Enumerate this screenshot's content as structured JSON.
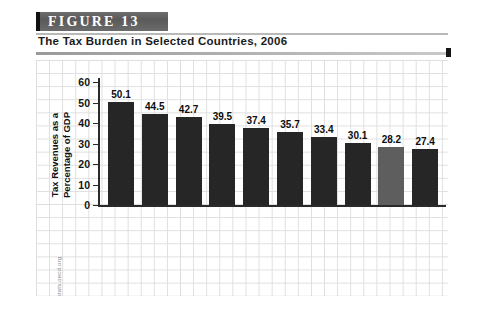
{
  "figure": {
    "banner_label": "FIGURE  13",
    "subtitle": "The Tax Burden in Selected Countries, 2006",
    "source": "SOURCE: www.stats.oecd.org"
  },
  "chart_data": {
    "type": "bar",
    "title": "The Tax Burden in Selected Countries, 2006",
    "xlabel": "",
    "ylabel": "Tax Revenues as a Percentage of GDP",
    "ylim": [
      0,
      60
    ],
    "yticks": [
      0,
      10,
      20,
      30,
      40,
      50,
      60
    ],
    "grid": true,
    "legend": "none",
    "categories": [
      "Sweden",
      "France",
      "Italy",
      "Netherlands",
      "United Kingdom",
      "Germany",
      "Canada",
      "Switzerland",
      "United States",
      "Japan"
    ],
    "category_lines": [
      [
        "Sweden"
      ],
      [
        "France"
      ],
      [
        "Italy"
      ],
      [
        "Netherlands"
      ],
      [
        "United",
        "Kingdom"
      ],
      [
        "Germany"
      ],
      [
        "Canada"
      ],
      [
        "Switzerland"
      ],
      [
        "United",
        "States"
      ],
      [
        "Japan"
      ]
    ],
    "values": [
      50.1,
      44.5,
      42.7,
      39.5,
      37.4,
      35.7,
      33.4,
      30.1,
      28.2,
      27.4
    ],
    "value_labels": [
      "50.1",
      "44.5",
      "42.7",
      "39.5",
      "37.4",
      "35.7",
      "33.4",
      "30.1",
      "28.2",
      "27.4"
    ],
    "highlight_index": 8,
    "bar_color": "#262626",
    "highlight_color": "#5e5e5e"
  },
  "axis": {
    "tick_labels": [
      "60",
      "50",
      "40",
      "30",
      "20",
      "10",
      "0"
    ],
    "title_line1": "Tax Revenues as a",
    "title_line2": "Percentage of GDP"
  }
}
